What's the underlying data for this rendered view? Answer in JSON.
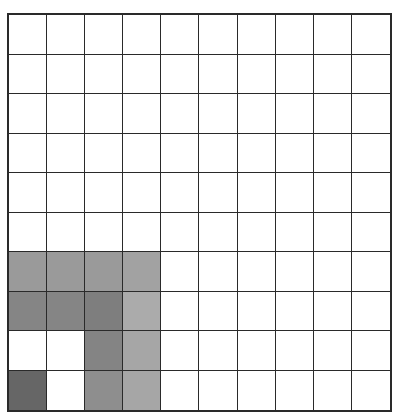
{
  "grid": {
    "rows": 10,
    "cols": 10,
    "line_color": "#2a2a2a",
    "empty_color": "#ffffff",
    "shaded_cells": [
      {
        "row": 6,
        "col": 0,
        "color": "#9a9a9a"
      },
      {
        "row": 6,
        "col": 1,
        "color": "#9a9a9a"
      },
      {
        "row": 6,
        "col": 2,
        "color": "#9a9a9a"
      },
      {
        "row": 6,
        "col": 3,
        "color": "#a2a2a2"
      },
      {
        "row": 7,
        "col": 0,
        "color": "#858585"
      },
      {
        "row": 7,
        "col": 1,
        "color": "#858585"
      },
      {
        "row": 7,
        "col": 2,
        "color": "#7e7e7e"
      },
      {
        "row": 7,
        "col": 3,
        "color": "#ababab"
      },
      {
        "row": 8,
        "col": 2,
        "color": "#848484"
      },
      {
        "row": 8,
        "col": 3,
        "color": "#a6a6a6"
      },
      {
        "row": 9,
        "col": 0,
        "color": "#666666"
      },
      {
        "row": 9,
        "col": 2,
        "color": "#8e8e8e"
      },
      {
        "row": 9,
        "col": 3,
        "color": "#a6a6a6"
      }
    ]
  }
}
